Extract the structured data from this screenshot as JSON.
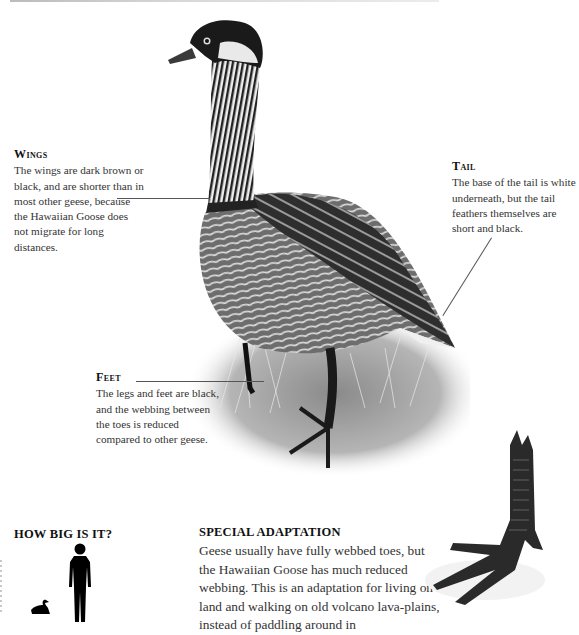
{
  "callouts": {
    "wings": {
      "heading": "Wings",
      "text": "The wings are dark brown or black, and are shorter than in most other geese, because the Hawaiian Goose does not migrate for long distances."
    },
    "tail": {
      "heading": "Tail",
      "text": "The base of the tail is white underneath, but the tail feathers themselves are short and black."
    },
    "feet": {
      "heading": "Feet",
      "text": "The legs and feet are black, and the webbing between the toes is reduced compared to other geese."
    }
  },
  "how_big": {
    "title": "HOW BIG IS IT?",
    "icons": [
      "human-silhouette",
      "goose-silhouette"
    ]
  },
  "special_adaptation": {
    "title": "SPECIAL ADAPTATION",
    "text": "Geese usually have fully webbed toes, but the Hawaiian Goose has much reduced webbing. This is an adaptation for living on land and walking on old volcano lava-plains, instead of paddling around in"
  },
  "illustrations": {
    "main": "Hawaiian Goose (Nene) standing in grass",
    "detail": "Close-up of goose foot with reduced webbing"
  },
  "colors": {
    "text": "#333333",
    "heading": "#111111",
    "leader_line": "#555555"
  }
}
